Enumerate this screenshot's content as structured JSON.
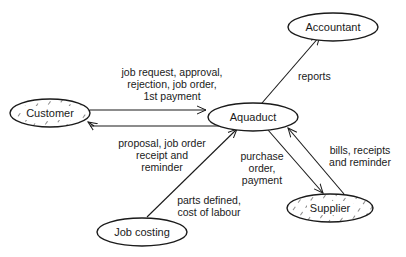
{
  "diagram": {
    "type": "context-diagram",
    "nodes": {
      "accountant": {
        "label": "Accountant",
        "hatched": false
      },
      "customer": {
        "label": "Customer",
        "hatched": true
      },
      "aquaduct": {
        "label": "Aquaduct",
        "hatched": false
      },
      "supplier": {
        "label": "Supplier",
        "hatched": true
      },
      "job_costing": {
        "label": "Job costing",
        "hatched": false
      }
    },
    "edges": {
      "customer_to_aquaduct": {
        "from": "Customer",
        "to": "Aquaduct",
        "lines": [
          "job request, approval,",
          "rejection, job order,",
          "1st payment"
        ]
      },
      "aquaduct_to_customer": {
        "from": "Aquaduct",
        "to": "Customer",
        "lines": [
          "proposal, job order",
          "receipt and",
          "reminder"
        ]
      },
      "aquaduct_to_accountant": {
        "from": "Aquaduct",
        "to": "Accountant",
        "lines": [
          "reports"
        ]
      },
      "aquaduct_to_supplier": {
        "from": "Aquaduct",
        "to": "Supplier",
        "lines": [
          "purchase",
          "order,",
          "payment"
        ]
      },
      "supplier_to_aquaduct": {
        "from": "Supplier",
        "to": "Aquaduct",
        "lines": [
          "bills, receipts",
          "and reminder"
        ]
      },
      "job_costing_to_aquaduct": {
        "from": "Job costing",
        "to": "Aquaduct",
        "lines": [
          "parts defined,",
          "cost of labour"
        ]
      }
    },
    "colors": {
      "stroke": "#1a1a1a",
      "background": "#ffffff"
    }
  }
}
